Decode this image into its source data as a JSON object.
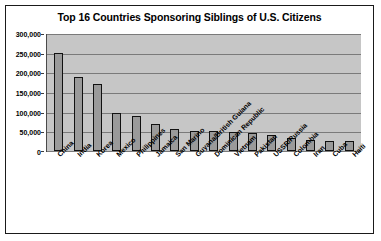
{
  "chart_data": {
    "type": "bar",
    "title": "Top 16 Countries Sponsoring Siblings of U.S. Citizens",
    "xlabel": "",
    "ylabel": "",
    "ylim": [
      0,
      300000
    ],
    "ytick_labels": [
      "300,000",
      "250,000",
      "200,000",
      "150,000",
      "100,000",
      "50,000",
      "0"
    ],
    "ytick_values": [
      300000,
      250000,
      200000,
      150000,
      100000,
      50000,
      0
    ],
    "grid": true,
    "legend": "none",
    "categories": [
      "China",
      "India",
      "Korea",
      "Mexico",
      "Philippines",
      "Jamaica",
      "San Marino",
      "Guyana/British Guiana",
      "Dominican Republic",
      "Vietnam",
      "Pakistan",
      "USSR/Russia",
      "Colombia",
      "Iran",
      "Cuba",
      "Haiti"
    ],
    "values": [
      250000,
      188000,
      170000,
      96000,
      90000,
      69000,
      55000,
      52000,
      50000,
      48000,
      46000,
      40000,
      34000,
      28000,
      26000,
      25000
    ],
    "bar_color": "#9a9a9a",
    "bar_border_color": "#111111",
    "plot_background": "#c6c6c6",
    "gridline_color": "#7a7a7a"
  }
}
